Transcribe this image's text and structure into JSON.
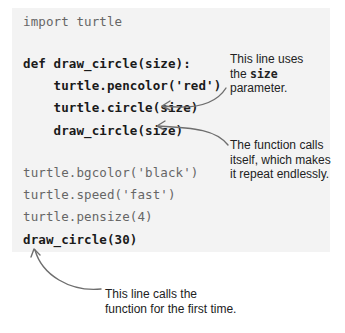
{
  "code_lines": [
    {
      "text": "import turtle",
      "style": "light"
    },
    {
      "text": "def draw_circle(size):",
      "style": "bold"
    },
    {
      "text": "    turtle.pencolor('red')",
      "style": "bold"
    },
    {
      "text": "    turtle.circle(size)",
      "style": "bold"
    },
    {
      "text": "    draw_circle(size)",
      "style": "bold"
    },
    {
      "text": "turtle.bgcolor('black')",
      "style": "light"
    },
    {
      "text": "turtle.speed('fast')",
      "style": "light"
    },
    {
      "text": "turtle.pensize(4)",
      "style": "light"
    },
    {
      "text": "draw_circle(30)",
      "style": "bold"
    }
  ],
  "annotations": {
    "size_param": {
      "line1": "This line uses",
      "line2_prefix": "the ",
      "line2_code": "size",
      "line3": "parameter."
    },
    "recursion": {
      "line1": "The function calls",
      "line2": "itself, which makes",
      "line3": "it repeat endlessly."
    },
    "first_call": {
      "line1": "This line calls the",
      "line2": "function for the first time."
    }
  },
  "colors": {
    "code_background": "#f3f3f3",
    "arrow": "#6e6e6e",
    "code_light": "#666666",
    "code_bold": "#1a1a1a"
  }
}
